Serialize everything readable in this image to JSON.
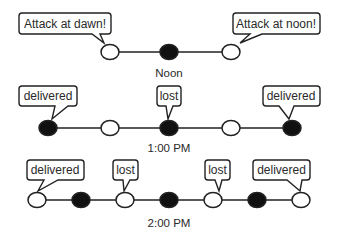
{
  "diagram": {
    "rows": [
      {
        "time_label": "Noon",
        "nodes": [
          "open",
          "filled",
          "open"
        ],
        "bubbles": [
          {
            "text": "Attack at dawn!",
            "attached_node": 0
          },
          {
            "text": "Attack at noon!",
            "attached_node": 2
          }
        ]
      },
      {
        "time_label": "1:00 PM",
        "nodes": [
          "filled",
          "open",
          "filled",
          "open",
          "filled"
        ],
        "bubbles": [
          {
            "text": "delivered",
            "attached_node": 0
          },
          {
            "text": "lost",
            "attached_node": 2
          },
          {
            "text": "delivered",
            "attached_node": 4
          }
        ]
      },
      {
        "time_label": "2:00 PM",
        "nodes": [
          "open",
          "filled",
          "open",
          "filled",
          "open",
          "filled",
          "open"
        ],
        "bubbles": [
          {
            "text": "delivered",
            "attached_node": 0
          },
          {
            "text": "lost",
            "attached_node": 2
          },
          {
            "text": "lost",
            "attached_node": 4
          },
          {
            "text": "delivered",
            "attached_node": 6
          }
        ]
      }
    ],
    "colors": {
      "line": "#222222",
      "filled": "#111111",
      "open": "#ffffff",
      "stroke": "#222222"
    }
  }
}
